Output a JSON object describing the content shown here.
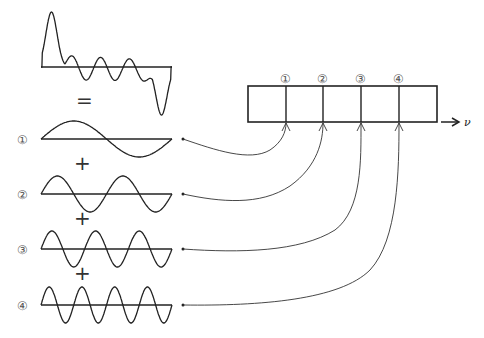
{
  "diagram": {
    "sum_wave": {
      "equals_sign": "="
    },
    "components": [
      {
        "label": "①",
        "cycles": 1,
        "plus": "+"
      },
      {
        "label": "②",
        "cycles": 2,
        "plus": "+"
      },
      {
        "label": "③",
        "cycles": 3,
        "plus": "+"
      },
      {
        "label": "④",
        "cycles": 4,
        "plus": ""
      }
    ],
    "spectrum": {
      "bins": [
        "①",
        "②",
        "③",
        "④"
      ],
      "axis_label": "ν"
    }
  }
}
